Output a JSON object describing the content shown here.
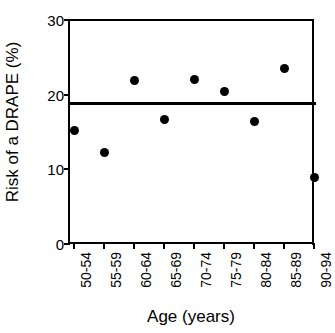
{
  "chart_data": {
    "type": "scatter",
    "title": "",
    "xlabel": "Age (years)",
    "ylabel": "Risk of a DRAPE (%)",
    "categories": [
      "50-54",
      "55-59",
      "60-64",
      "65-69",
      "70-74",
      "75-79",
      "80-84",
      "85-89",
      "90-94"
    ],
    "values": [
      15.2,
      12.2,
      21.9,
      16.7,
      22.0,
      20.4,
      16.4,
      23.5,
      8.9
    ],
    "series": [
      {
        "name": "Risk of a DRAPE (%)",
        "values": [
          15.2,
          12.2,
          21.9,
          16.7,
          22.0,
          20.4,
          16.4,
          23.5,
          8.9
        ],
        "marker": "filled-circle",
        "color": "#000000"
      }
    ],
    "reference_line": {
      "name": "Overall risk",
      "value": 18.8,
      "orientation": "horizontal",
      "color": "#000000"
    },
    "ylim": [
      0,
      30
    ],
    "yticks": [
      0,
      10,
      20,
      30
    ],
    "ytick_labels": [
      "0",
      "10",
      "20",
      "30"
    ],
    "grid": false,
    "legend": "none",
    "marker_color": "#000000",
    "axis_color": "#000000",
    "background_color": "#ffffff"
  },
  "axes": {
    "y_title": "Risk of a DRAPE (%)",
    "x_title": "Age (years)"
  }
}
